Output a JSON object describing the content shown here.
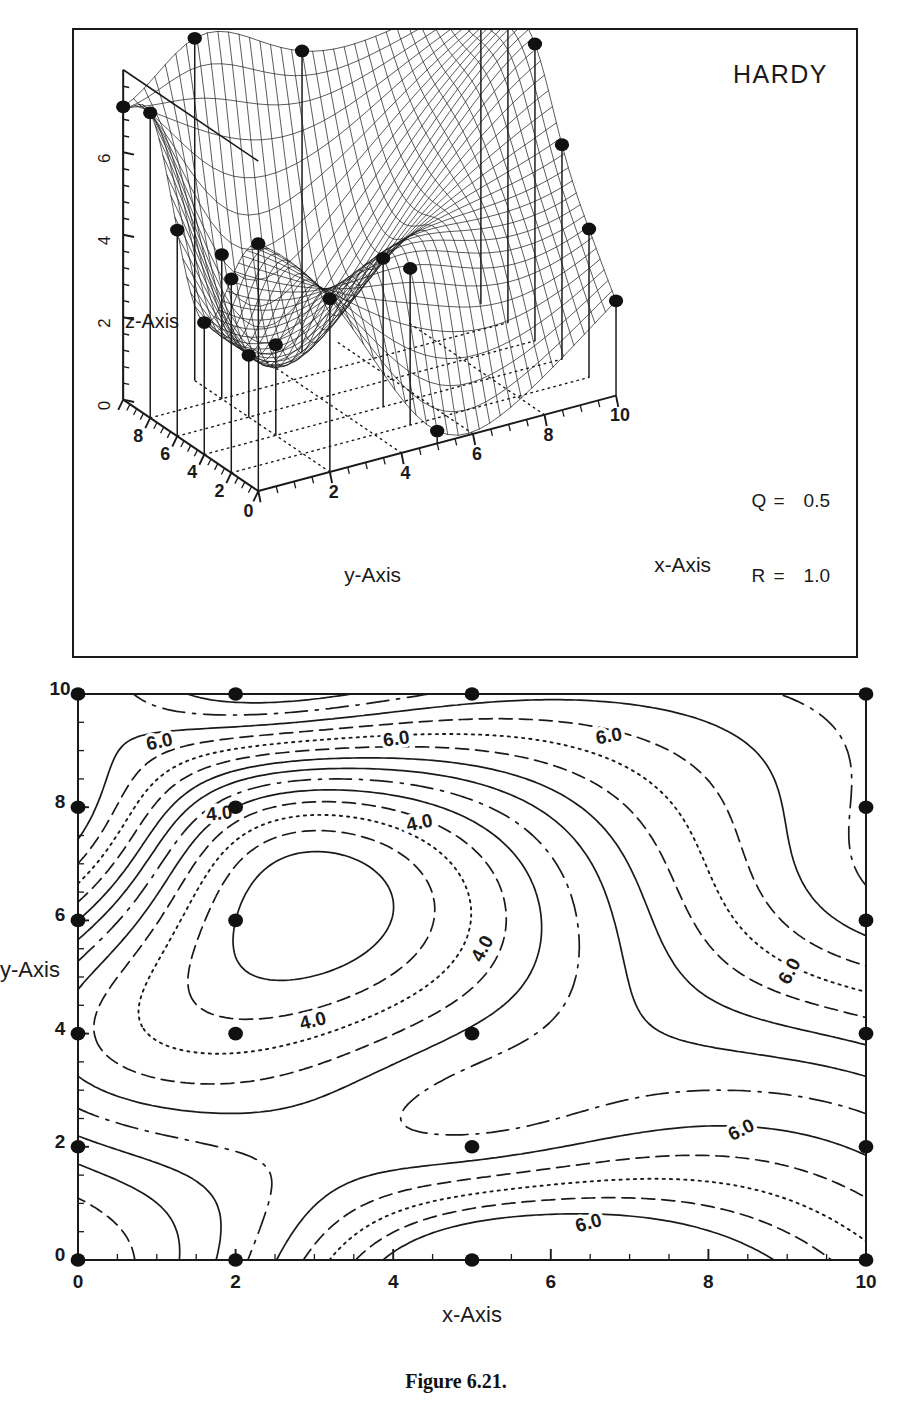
{
  "figure": {
    "caption": "Figure 6.21.",
    "method_title": "HARDY"
  },
  "surface_panel": {
    "title": "HARDY",
    "params": [
      {
        "key": "Q",
        "eq": "=",
        "value": "0.5"
      },
      {
        "key": "R",
        "eq": "=",
        "value": "1.0"
      }
    ],
    "x_axis_label": "x-Axis",
    "y_axis_label": "y-Axis",
    "z_axis_label": "z-Axis",
    "x_ticks": [
      "0",
      "2",
      "4",
      "6",
      "8",
      "10"
    ],
    "y_ticks": [
      "0",
      "2",
      "4",
      "6",
      "8"
    ],
    "z_ticks": [
      "0",
      "2",
      "4",
      "6",
      "8"
    ]
  },
  "contour_panel": {
    "x_axis_label": "x-Axis",
    "y_axis_label": "y-Axis",
    "x_ticks": [
      "0",
      "2",
      "4",
      "6",
      "8",
      "10"
    ],
    "y_ticks": [
      "0",
      "2",
      "4",
      "6",
      "8",
      "10"
    ],
    "contour_labels": [
      {
        "text": "6.0",
        "x": 1.05,
        "y": 9.05,
        "rot": -12
      },
      {
        "text": "6.0",
        "x": 4.05,
        "y": 9.1,
        "rot": -8
      },
      {
        "text": "6.0",
        "x": 6.75,
        "y": 9.15,
        "rot": -10
      },
      {
        "text": "4.0",
        "x": 1.8,
        "y": 7.78,
        "rot": -6
      },
      {
        "text": "4.0",
        "x": 4.35,
        "y": 7.62,
        "rot": -12
      },
      {
        "text": "4.0",
        "x": 5.2,
        "y": 5.45,
        "rot": -62
      },
      {
        "text": "4.0",
        "x": 3.0,
        "y": 4.12,
        "rot": -14
      },
      {
        "text": "6.0",
        "x": 9.1,
        "y": 5.05,
        "rot": -62
      },
      {
        "text": "6.0",
        "x": 8.45,
        "y": 2.2,
        "rot": -26
      },
      {
        "text": "6.0",
        "x": 6.5,
        "y": 0.55,
        "rot": -16
      }
    ]
  },
  "chart_data": {
    "type": "scatter",
    "title": "HARDY",
    "xlabel": "x-Axis",
    "ylabel": "y-Axis",
    "zlabel": "z-Axis",
    "xlim": [
      0,
      10
    ],
    "ylim": [
      0,
      10
    ],
    "zlim": [
      0,
      8
    ],
    "grid": true,
    "legend": "none",
    "parameters": {
      "Q": 0.5,
      "R": 1.0
    },
    "contour_levels": [
      4.0,
      6.0
    ],
    "data_points": [
      {
        "x": 0,
        "y": 0,
        "z": 6.0
      },
      {
        "x": 0,
        "y": 2,
        "z": 4.7
      },
      {
        "x": 0,
        "y": 4,
        "z": 3.2
      },
      {
        "x": 0,
        "y": 6,
        "z": 5.0
      },
      {
        "x": 0,
        "y": 8,
        "z": 7.4
      },
      {
        "x": 0,
        "y": 10,
        "z": 7.1
      },
      {
        "x": 2,
        "y": 0,
        "z": 4.2
      },
      {
        "x": 2,
        "y": 4,
        "z": 2.2
      },
      {
        "x": 2,
        "y": 6,
        "z": 1.5
      },
      {
        "x": 2,
        "y": 8,
        "z": 3.5
      },
      {
        "x": 2,
        "y": 10,
        "z": 8.3
      },
      {
        "x": 5,
        "y": 0,
        "z": 0.3
      },
      {
        "x": 5,
        "y": 2,
        "z": 3.8
      },
      {
        "x": 5,
        "y": 4,
        "z": 3.6
      },
      {
        "x": 5,
        "y": 10,
        "z": 7.3
      },
      {
        "x": 10,
        "y": 0,
        "z": 2.3
      },
      {
        "x": 10,
        "y": 2,
        "z": 3.6
      },
      {
        "x": 10,
        "y": 4,
        "z": 5.2
      },
      {
        "x": 10,
        "y": 6,
        "z": 7.2
      },
      {
        "x": 10,
        "y": 8,
        "z": 7.6
      },
      {
        "x": 10,
        "y": 10,
        "z": 7.8
      }
    ]
  }
}
